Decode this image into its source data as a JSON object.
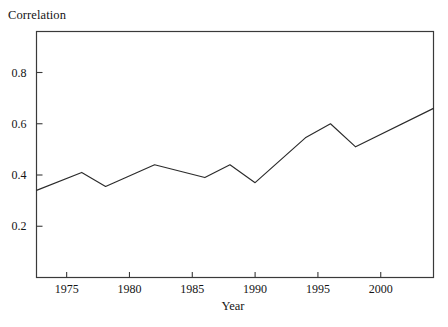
{
  "chart_data": {
    "type": "line",
    "title": "",
    "xlabel": "Year",
    "ylabel": "Correlation",
    "xlim": [
      1972.6,
      2004.2
    ],
    "ylim": [
      0.0,
      0.96
    ],
    "grid": false,
    "legend": "none",
    "xticks": [
      1975,
      1980,
      1985,
      1990,
      1995,
      2000
    ],
    "xtick_labels": [
      "1975",
      "1980",
      "1985",
      "1990",
      "1995",
      "2000"
    ],
    "yticks": [
      0.2,
      0.4,
      0.6,
      0.8
    ],
    "ytick_labels": [
      "0.2",
      "0.4",
      "0.6",
      "0.8"
    ],
    "series": [
      {
        "name": "Correlation",
        "color": "#2b2b2b",
        "x": [
          1972.6,
          1976.2,
          1978.1,
          1982.0,
          1986.0,
          1988.0,
          1990.0,
          1994.0,
          1996.0,
          1998.0,
          2004.2
        ],
        "values": [
          0.34,
          0.41,
          0.355,
          0.44,
          0.39,
          0.44,
          0.37,
          0.545,
          0.6,
          0.51,
          0.66
        ]
      }
    ]
  },
  "axes": {
    "frame_color": "#3a3a3a",
    "line_color": "#2b2b2b"
  }
}
